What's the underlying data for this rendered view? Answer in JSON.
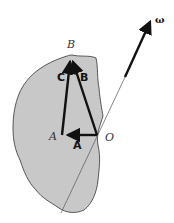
{
  "diagram": {
    "type": "rigid-body-rotation-vector-diagram",
    "colors": {
      "body_fill": "#c8c8c8",
      "body_stroke": "#333333",
      "vector": "#111111",
      "axis_line": "#555555",
      "background": "#ffffff"
    },
    "points": {
      "B": {
        "label": "B",
        "x": 71,
        "y": 55
      },
      "A": {
        "label": "A",
        "x": 62,
        "y": 135
      },
      "O": {
        "label": "O",
        "x": 97,
        "y": 135
      }
    },
    "vectors": [
      {
        "name": "A",
        "label": "A",
        "from": "O",
        "to": "A"
      },
      {
        "name": "B",
        "label": "B",
        "from": "O",
        "to": "B"
      },
      {
        "name": "C",
        "label": "C",
        "from": "A",
        "to": "B"
      }
    ],
    "axis": {
      "label": "ω",
      "description": "angular velocity vector along the rotation axis through O"
    }
  }
}
